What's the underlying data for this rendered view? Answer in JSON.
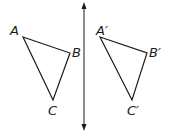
{
  "diagram": {
    "line": {
      "x": 84,
      "y1": 4,
      "y2": 130,
      "arrows": "both"
    },
    "triangles": [
      {
        "name": "ABC",
        "vertices": [
          {
            "label": "A",
            "x": 23,
            "y": 37
          },
          {
            "label": "B",
            "x": 70,
            "y": 53
          },
          {
            "label": "C",
            "x": 53,
            "y": 100
          }
        ]
      },
      {
        "name": "A'B'C'",
        "vertices": [
          {
            "label": "A′",
            "x": 100,
            "y": 37
          },
          {
            "label": "B′",
            "x": 147,
            "y": 53
          },
          {
            "label": "C′",
            "x": 132,
            "y": 100
          }
        ]
      }
    ],
    "labels": {
      "A": "A",
      "B": "B",
      "C": "C",
      "A_prime": "A′",
      "B_prime": "B′",
      "C_prime": "C′"
    },
    "colors": {
      "stroke": "#1a1a1a",
      "background": "#ffffff"
    }
  }
}
